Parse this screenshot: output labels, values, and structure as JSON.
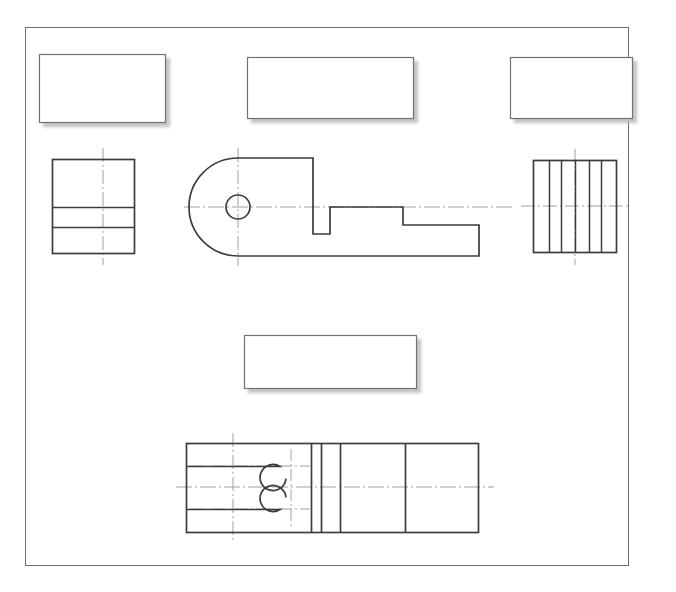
{
  "document": {
    "title": "Orthographic Multiview Engineering Drawing",
    "sheet_label": "",
    "top_strip_text": "",
    "background_color": "#ffffff",
    "line_color": "#3c3c3c",
    "centerline_color": "#9a9a9a",
    "shadow_color": "#cfcfcf",
    "border_color": "#6b6b6b"
  },
  "sheet_border": {
    "name": "sheet-border",
    "x": 25,
    "y": 27,
    "width": 603,
    "height": 538,
    "stroke_width": 1
  },
  "dimension_boxes": [
    {
      "name": "dimension-box-top-left",
      "label": "",
      "x": 39,
      "y": 54,
      "width": 126,
      "height": 68
    },
    {
      "name": "dimension-box-top-center",
      "label": "",
      "x": 247,
      "y": 57,
      "width": 166,
      "height": 61
    },
    {
      "name": "dimension-box-top-right",
      "label": "",
      "x": 510,
      "y": 57,
      "width": 122,
      "height": 61
    },
    {
      "name": "dimension-box-middle-center",
      "label": "",
      "x": 244,
      "y": 335,
      "width": 172,
      "height": 53
    }
  ],
  "views": {
    "left_end_view": {
      "name": "left-end-view",
      "title": "",
      "outline": {
        "x": 52,
        "y": 159,
        "width": 82,
        "height": 94
      },
      "horizontal_divider_lines": [
        {
          "name": "divider-line-upper",
          "y": 207
        },
        {
          "name": "divider-line-lower",
          "y": 227
        }
      ],
      "vertical_centerline": {
        "x": 103,
        "y1": 148,
        "y2": 265
      }
    },
    "front_profile_view": {
      "name": "front-profile-view",
      "title": "",
      "arc_center": {
        "x": 238,
        "y": 207
      },
      "arc_radius": 49,
      "hole": {
        "cx": 238,
        "cy": 207,
        "r": 12
      },
      "top_edge_y": 158,
      "bottom_edge_y": 256,
      "step_1_x": 313,
      "notch_left_x": 313,
      "notch_right_x": 330,
      "notch_bottom_y": 234,
      "mid_level_y": 207,
      "step_2_x": 403,
      "step_2_bottom_y": 225,
      "right_edge_x": 479,
      "horizontal_centerline": {
        "y": 207,
        "x1": 184,
        "x2": 513
      },
      "vertical_centerline": {
        "x": 238,
        "y1": 148,
        "y2": 266
      }
    },
    "right_end_view": {
      "name": "right-end-view",
      "title": "",
      "outline": {
        "x": 533,
        "y": 160,
        "width": 83,
        "height": 92
      },
      "internal_vertical_lines_x": [
        549,
        561,
        575,
        589,
        601
      ],
      "vertical_centerline": {
        "x": 575,
        "y1": 149,
        "y2": 265
      },
      "horizontal_centerline": {
        "y": 206,
        "x1": 521,
        "x2": 628
      }
    },
    "bottom_plan_view": {
      "name": "bottom-plan-view",
      "title": "",
      "outline": {
        "x": 186,
        "y": 443,
        "width": 292,
        "height": 89
      },
      "horizontal_centerline": {
        "y": 487,
        "x1": 176,
        "x2": 494
      },
      "vertical_centerlines_x": [
        233,
        291
      ],
      "slot_upper": {
        "name": "slot-upper",
        "y_top": 443,
        "y_bottom": 466,
        "arc_center": {
          "x": 291,
          "y": 466
        },
        "arc_radius": 13
      },
      "slot_lower": {
        "name": "slot-lower",
        "y_top": 509,
        "y_bottom": 532,
        "arc_center": {
          "x": 291,
          "y": 509
        },
        "arc_radius": 13
      },
      "internal_vertical_lines_x": [
        311,
        321,
        340,
        405
      ]
    }
  }
}
